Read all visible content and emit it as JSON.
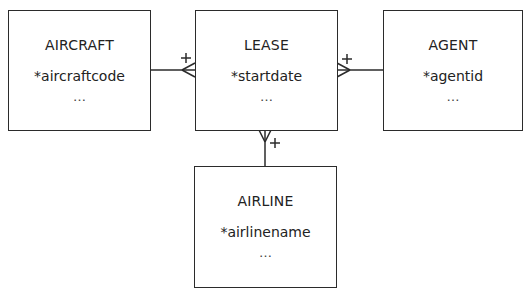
{
  "diagram": {
    "type": "entity-relationship",
    "notation": "crow's foot",
    "entities": [
      {
        "id": "aircraft",
        "name": "AIRCRAFT",
        "key_attribute": "*aircraftcode",
        "more": "…"
      },
      {
        "id": "lease",
        "name": "LEASE",
        "key_attribute": "*startdate",
        "more": "…"
      },
      {
        "id": "agent",
        "name": "AGENT",
        "key_attribute": "*agentid",
        "more": "…"
      },
      {
        "id": "airline",
        "name": "AIRLINE",
        "key_attribute": "*airlinename",
        "more": "…"
      }
    ],
    "relationships": [
      {
        "from": "AIRCRAFT",
        "to": "LEASE",
        "from_cardinality": "one",
        "to_cardinality": "many",
        "marker": "+"
      },
      {
        "from": "AGENT",
        "to": "LEASE",
        "from_cardinality": "one",
        "to_cardinality": "many",
        "marker": "+"
      },
      {
        "from": "AIRLINE",
        "to": "LEASE",
        "from_cardinality": "one",
        "to_cardinality": "many",
        "marker": "+"
      }
    ],
    "colors": {
      "line": "#2b2b2b",
      "background": "#ffffff"
    }
  }
}
